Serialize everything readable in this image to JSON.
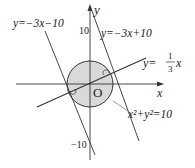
{
  "diagram": {
    "type": "coordinate-geometry",
    "axes": {
      "x_label": "x",
      "y_label": "y",
      "origin_label": "O",
      "y_tick_top": "10",
      "y_tick_bottom": "−10"
    },
    "circle": {
      "equation": "x²+y²=10",
      "center": [
        0,
        0
      ],
      "radius_squared": 10,
      "fill": "#d9d9d9",
      "stroke": "#333333"
    },
    "lines": [
      {
        "id": "line-upper",
        "label": "y=−3x+10",
        "slope": -3,
        "intercept": 10
      },
      {
        "id": "line-lower",
        "label": "y=−3x−10",
        "slope": -3,
        "intercept": -10
      },
      {
        "id": "line-diameter",
        "label_prefix": "y=",
        "label_fraction_num": "1",
        "label_fraction_den": "3",
        "label_suffix": "x",
        "slope": 0.3333,
        "intercept": 0
      }
    ],
    "annotations": {
      "right_angle_markers": 2,
      "tangent_points": [
        "(1,3)",
        "(−1,−3)"
      ]
    },
    "colors": {
      "stroke": "#333333",
      "circle_fill": "#d9d9d9",
      "background": "#ffffff"
    }
  }
}
